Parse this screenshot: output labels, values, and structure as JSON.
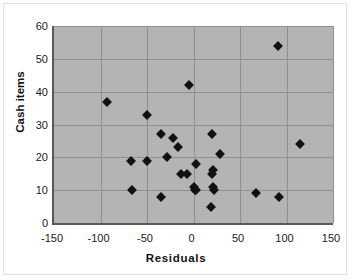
{
  "chart_data": {
    "type": "scatter",
    "title": "",
    "xlabel": "Residuals",
    "ylabel": "Cash items",
    "xlim": [
      -150,
      150
    ],
    "ylim": [
      0,
      60
    ],
    "xticks": [
      "-150",
      "-100",
      "-50",
      "0",
      "50",
      "100",
      "150"
    ],
    "yticks": [
      "0",
      "10",
      "20",
      "30",
      "40",
      "50",
      "60"
    ],
    "xtick_values": [
      -150,
      -100,
      -50,
      0,
      50,
      100,
      150
    ],
    "ytick_values": [
      0,
      10,
      20,
      30,
      40,
      50,
      60
    ],
    "grid": "horizontal",
    "legend": "none",
    "plot_background": "#b4b4b4",
    "gridline_color": "#8f8f8f",
    "marker_color": "#111111",
    "marker_shape": "diamond",
    "series": [
      {
        "name": "Cash items vs Residuals",
        "points": [
          [
            91,
            54
          ],
          [
            -5,
            42
          ],
          [
            -93,
            37
          ],
          [
            -50,
            33
          ],
          [
            -35,
            27
          ],
          [
            20,
            27
          ],
          [
            -22,
            26
          ],
          [
            114,
            24
          ],
          [
            -17,
            23
          ],
          [
            28,
            21
          ],
          [
            -29,
            20
          ],
          [
            -67,
            19
          ],
          [
            -50,
            19
          ],
          [
            3,
            18
          ],
          [
            -13,
            15
          ],
          [
            -7,
            15
          ],
          [
            20,
            15
          ],
          [
            21,
            16
          ],
          [
            1,
            11
          ],
          [
            2,
            10
          ],
          [
            3,
            10
          ],
          [
            21,
            11
          ],
          [
            22,
            10
          ],
          [
            -66,
            10
          ],
          [
            67,
            9
          ],
          [
            92,
            8
          ],
          [
            -35,
            8
          ],
          [
            19,
            5
          ]
        ]
      }
    ]
  },
  "axis": {
    "x_title": "Residuals",
    "y_title": "Cash items"
  }
}
